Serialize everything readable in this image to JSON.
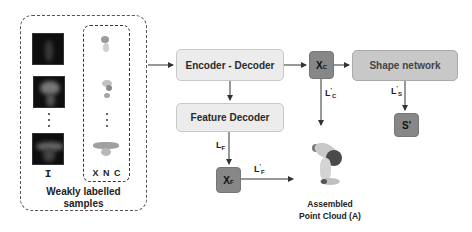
{
  "inputs_panel": {
    "caption_line1": "Weakly labelled",
    "caption_line2": "samples",
    "image_column_label": "I",
    "pointcloud_column_label": "X N C",
    "ellipsis": "⋮"
  },
  "nodes": {
    "encoder_decoder": "Encoder - Decoder",
    "feature_decoder": "Feature Decoder",
    "xc": {
      "base": "X",
      "sub": "C"
    },
    "xf": {
      "base": "X",
      "sub": "F"
    },
    "shape_network": "Shape network",
    "s_prime": "S'",
    "assembled_line1": "Assembled",
    "assembled_line2": "Point Cloud (A)"
  },
  "edge_labels": {
    "lc_prime": {
      "base": "L",
      "sup": "'",
      "sub": "C"
    },
    "ls_prime": {
      "base": "L",
      "sup": "'",
      "sub": "S"
    },
    "lf": {
      "base": "L",
      "sub": "F"
    },
    "lf_prime": {
      "base": "L",
      "sup": "'",
      "sub": "F"
    }
  },
  "colors": {
    "light_box": "#ececec",
    "dark_box": "#878787",
    "shape_box": "#c8c8c8",
    "arrow": "#333333"
  }
}
